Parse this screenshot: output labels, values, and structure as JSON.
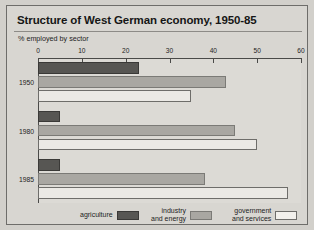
{
  "card": {
    "title": "Structure of West German economy, 1950-85",
    "subtitle": "% employed by sector"
  },
  "chart_data": {
    "type": "bar",
    "orientation": "horizontal",
    "title": "Structure of West German economy, 1950-85",
    "subtitle": "% employed by sector",
    "xlabel": "",
    "ylabel": "",
    "xlim": [
      0,
      60
    ],
    "xticks": [
      0,
      10,
      20,
      30,
      40,
      50,
      60
    ],
    "xtick_labels": [
      "0",
      "10",
      "20",
      "30",
      "40",
      "50",
      "60"
    ],
    "categories": [
      "1950",
      "1980",
      "1985"
    ],
    "grid": false,
    "legend_position": "bottom",
    "series": [
      {
        "name": "agriculture",
        "color": "#575653",
        "values": [
          23,
          5,
          5
        ]
      },
      {
        "name": "industry\nand energy",
        "color": "#a9a7a2",
        "values": [
          43,
          45,
          38
        ]
      },
      {
        "name": "government\nand services",
        "color": "#f2f0ec",
        "values": [
          35,
          50,
          57
        ]
      }
    ]
  },
  "legend": {
    "items": [
      {
        "label": "agriculture",
        "swatch": "agriculture"
      },
      {
        "label": "industry\nand energy",
        "swatch": "industry"
      },
      {
        "label": "government\nand services",
        "swatch": "government"
      }
    ]
  }
}
